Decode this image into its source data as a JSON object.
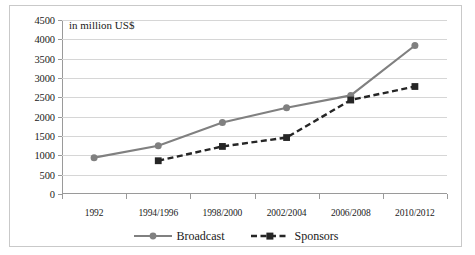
{
  "chart_data": {
    "type": "line",
    "title": "",
    "axis_note": "in million US$",
    "xlabel": "",
    "ylabel": "",
    "categories": [
      "1992",
      "1994/1996",
      "1998/2000",
      "2002/2004",
      "2006/2008",
      "2010/2012"
    ],
    "ylim": [
      0,
      4500
    ],
    "ytick_step": 500,
    "yticks": [
      "0",
      "500",
      "1000",
      "1500",
      "2000",
      "2500",
      "3000",
      "3500",
      "4000",
      "4500"
    ],
    "grid": true,
    "legend_position": "bottom",
    "series": [
      {
        "name": "Broadcast",
        "color": "#808080",
        "style": "solid",
        "marker": "circle",
        "values": [
          940,
          1250,
          1850,
          2230,
          2550,
          3840
        ]
      },
      {
        "name": "Sponsors",
        "color": "#262626",
        "style": "dashed",
        "marker": "square",
        "values": [
          null,
          860,
          1230,
          1460,
          2430,
          2780
        ]
      }
    ]
  },
  "colors": {
    "broadcast": "#808080",
    "sponsors": "#262626",
    "gridline": "#d6d6d6",
    "axis": "#9a9a9a",
    "border": "#c9c9c9"
  }
}
